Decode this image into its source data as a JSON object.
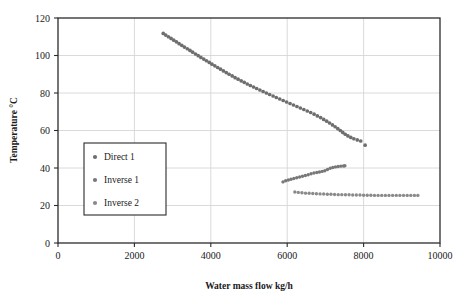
{
  "chart_data": {
    "type": "scatter",
    "title": "",
    "xlabel": "Water mass flow kg/h",
    "ylabel": "Temperature °C",
    "xlim": [
      0,
      10000
    ],
    "ylim": [
      0,
      120
    ],
    "xticks": [
      0,
      2000,
      4000,
      6000,
      8000,
      10000
    ],
    "yticks": [
      0,
      20,
      40,
      60,
      80,
      100,
      120
    ],
    "grid": true,
    "legend_position": "inner-left",
    "marker": "filled-circle",
    "series": [
      {
        "name": "Direct 1",
        "color": "#6e6e6e",
        "points": [
          [
            2755,
            111.8
          ],
          [
            2820,
            110.9
          ],
          [
            2890,
            110.0
          ],
          [
            2960,
            109.1
          ],
          [
            3030,
            108.2
          ],
          [
            3100,
            107.3
          ],
          [
            3170,
            106.3
          ],
          [
            3240,
            105.4
          ],
          [
            3310,
            104.5
          ],
          [
            3385,
            103.6
          ],
          [
            3455,
            102.7
          ],
          [
            3525,
            101.8
          ],
          [
            3600,
            100.8
          ],
          [
            3670,
            99.9
          ],
          [
            3740,
            99.0
          ],
          [
            3815,
            98.1
          ],
          [
            3885,
            97.2
          ],
          [
            3960,
            96.3
          ],
          [
            4030,
            95.4
          ],
          [
            4105,
            94.5
          ],
          [
            4180,
            93.6
          ],
          [
            4255,
            92.7
          ],
          [
            4330,
            91.8
          ],
          [
            4405,
            90.9
          ],
          [
            4480,
            90.0
          ],
          [
            4560,
            89.1
          ],
          [
            4635,
            88.2
          ],
          [
            4715,
            87.4
          ],
          [
            4795,
            86.5
          ],
          [
            4875,
            85.7
          ],
          [
            4955,
            84.8
          ],
          [
            5035,
            84.0
          ],
          [
            5120,
            83.2
          ],
          [
            5200,
            82.4
          ],
          [
            5285,
            81.6
          ],
          [
            5370,
            80.8
          ],
          [
            5455,
            80.0
          ],
          [
            5540,
            79.2
          ],
          [
            5630,
            78.4
          ],
          [
            5715,
            77.6
          ],
          [
            5805,
            76.8
          ],
          [
            5895,
            76.0
          ],
          [
            5985,
            75.2
          ],
          [
            6075,
            74.4
          ],
          [
            6165,
            73.6
          ],
          [
            6255,
            72.8
          ],
          [
            6345,
            72.0
          ],
          [
            6435,
            71.2
          ],
          [
            6525,
            70.4
          ],
          [
            6615,
            69.6
          ],
          [
            6705,
            68.7
          ],
          [
            6790,
            67.8
          ],
          [
            6875,
            66.9
          ],
          [
            6955,
            65.9
          ],
          [
            7035,
            65.0
          ],
          [
            7110,
            64.0
          ],
          [
            7185,
            63.0
          ],
          [
            7255,
            62.0
          ],
          [
            7325,
            61.0
          ],
          [
            7390,
            60.0
          ],
          [
            7455,
            59.0
          ],
          [
            7520,
            58.0
          ],
          [
            7590,
            57.1
          ],
          [
            7665,
            56.3
          ],
          [
            7745,
            55.6
          ],
          [
            7835,
            55.0
          ],
          [
            7925,
            54.4
          ],
          [
            8040,
            52.2
          ]
        ]
      },
      {
        "name": "Inverse 1",
        "color": "#787878",
        "points": [
          [
            5890,
            32.6
          ],
          [
            5960,
            33.2
          ],
          [
            6030,
            33.6
          ],
          [
            6100,
            34.0
          ],
          [
            6175,
            34.4
          ],
          [
            6250,
            34.8
          ],
          [
            6325,
            35.2
          ],
          [
            6400,
            35.6
          ],
          [
            6475,
            36.0
          ],
          [
            6550,
            36.4
          ],
          [
            6625,
            36.9
          ],
          [
            6700,
            37.3
          ],
          [
            6775,
            37.6
          ],
          [
            6845,
            37.9
          ],
          [
            6915,
            38.2
          ],
          [
            6985,
            38.5
          ],
          [
            7055,
            39.2
          ],
          [
            7125,
            39.9
          ],
          [
            7195,
            40.3
          ],
          [
            7265,
            40.6
          ],
          [
            7335,
            40.8
          ],
          [
            7405,
            41.0
          ],
          [
            7475,
            41.1
          ],
          [
            7510,
            41.2
          ]
        ]
      },
      {
        "name": "Inverse 2",
        "color": "#8a8a8a",
        "points": [
          [
            6200,
            27.2
          ],
          [
            6290,
            27.0
          ],
          [
            6385,
            26.8
          ],
          [
            6480,
            26.6
          ],
          [
            6575,
            26.5
          ],
          [
            6670,
            26.4
          ],
          [
            6765,
            26.3
          ],
          [
            6860,
            26.2
          ],
          [
            6955,
            26.1
          ],
          [
            7050,
            26.0
          ],
          [
            7145,
            26.0
          ],
          [
            7240,
            25.9
          ],
          [
            7335,
            25.8
          ],
          [
            7430,
            25.8
          ],
          [
            7525,
            25.7
          ],
          [
            7620,
            25.7
          ],
          [
            7715,
            25.6
          ],
          [
            7810,
            25.6
          ],
          [
            7905,
            25.6
          ],
          [
            8000,
            25.5
          ],
          [
            8095,
            25.5
          ],
          [
            8190,
            25.5
          ],
          [
            8285,
            25.4
          ],
          [
            8380,
            25.4
          ],
          [
            8475,
            25.4
          ],
          [
            8570,
            25.4
          ],
          [
            8665,
            25.4
          ],
          [
            8760,
            25.4
          ],
          [
            8855,
            25.4
          ],
          [
            8950,
            25.4
          ],
          [
            9045,
            25.4
          ],
          [
            9140,
            25.4
          ],
          [
            9235,
            25.4
          ],
          [
            9330,
            25.4
          ],
          [
            9420,
            25.4
          ]
        ]
      }
    ]
  },
  "axes": {
    "x_title": "Water mass flow kg/h",
    "y_title": "Temperature °C",
    "x_tick_labels": [
      "0",
      "2000",
      "4000",
      "6000",
      "8000",
      "10000"
    ],
    "y_tick_labels": [
      "0",
      "20",
      "40",
      "60",
      "80",
      "100",
      "120"
    ]
  },
  "legend": {
    "items": [
      {
        "label": "Direct 1",
        "color": "#6e6e6e"
      },
      {
        "label": "Inverse 1",
        "color": "#787878"
      },
      {
        "label": "Inverse 2",
        "color": "#8a8a8a"
      }
    ]
  },
  "style": {
    "frame_color": "#2b2b2b",
    "grid_color": "#d6d6d6",
    "background": "#ffffff",
    "text_color": "#1a1a1a"
  }
}
